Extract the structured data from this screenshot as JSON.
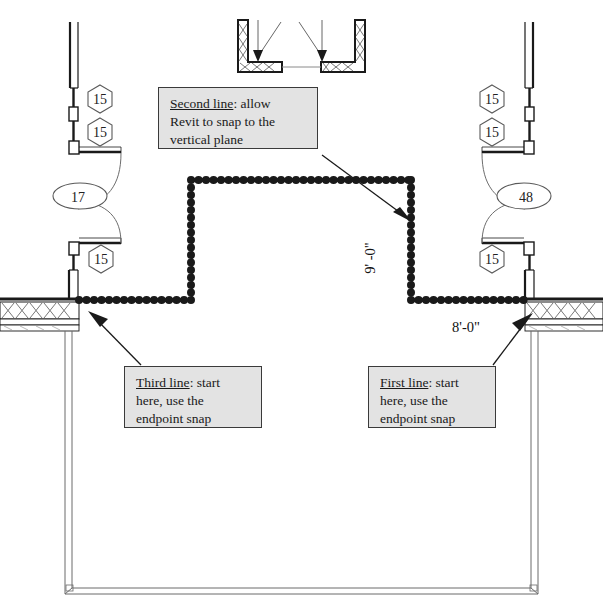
{
  "drawing": {
    "title": "Revit floor plan sketch with snap instructions",
    "dimensions": {
      "vertical": "9' -0\"",
      "horizontal": "8'-0\""
    },
    "tags": {
      "hex_left_upper": "15",
      "hex_left_lower": "15",
      "hex_left_bottom": "15",
      "hex_right_upper": "15",
      "hex_right_lower": "15",
      "hex_right_bottom": "15",
      "oval_left": "17",
      "oval_right": "48"
    },
    "callouts": {
      "second": {
        "lead": "Second line",
        "rest": ": allow",
        "line2": "Revit to snap to the",
        "line3": "vertical plane"
      },
      "third": {
        "lead": "Third line",
        "rest": ": start",
        "line2": "here, use the",
        "line3": "endpoint snap"
      },
      "first": {
        "lead": "First line",
        "rest": ": start",
        "line2": "here, use the",
        "line3": "endpoint snap"
      }
    },
    "colors": {
      "callout_fill": "#e3e3e3",
      "callout_border": "#3a3a3a",
      "line": "#1a1a1a",
      "sketch_dots": "#1a1a1a"
    }
  }
}
